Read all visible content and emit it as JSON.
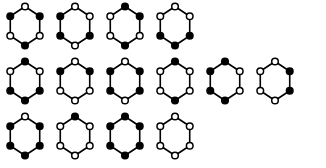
{
  "figure": {
    "background_color": "#ffffff",
    "edge_color": "#000000",
    "vertex_black_color": "#000000",
    "vertex_white_color": "#ffffff",
    "vertex_order": [
      "top",
      "upper-right",
      "lower-right",
      "bottom",
      "lower-left",
      "upper-left"
    ],
    "row_counts": [
      4,
      6,
      4
    ],
    "total_hexagons": 14
  },
  "rows": [
    {
      "index": 1,
      "hexagons": [
        {
          "id": "r1c1",
          "black_count": 3,
          "vertices": [
            "white",
            "black",
            "white",
            "black",
            "white",
            "black"
          ]
        },
        {
          "id": "r1c2",
          "black_count": 3,
          "vertices": [
            "white",
            "white",
            "black",
            "white",
            "black",
            "black"
          ]
        },
        {
          "id": "r1c3",
          "black_count": 3,
          "vertices": [
            "black",
            "black",
            "white",
            "black",
            "white",
            "white"
          ]
        },
        {
          "id": "r1c4",
          "black_count": 3,
          "vertices": [
            "white",
            "white",
            "black",
            "black",
            "black",
            "white"
          ]
        }
      ]
    },
    {
      "index": 2,
      "hexagons": [
        {
          "id": "r2c1",
          "black_count": 4,
          "vertices": [
            "black",
            "white",
            "black",
            "black",
            "black",
            "white"
          ]
        },
        {
          "id": "r2c2",
          "black_count": 2,
          "vertices": [
            "white",
            "black",
            "white",
            "white",
            "white",
            "black"
          ]
        },
        {
          "id": "r2c3",
          "black_count": 4,
          "vertices": [
            "white",
            "black",
            "black",
            "white",
            "black",
            "black"
          ]
        },
        {
          "id": "r2c4",
          "black_count": 2,
          "vertices": [
            "black",
            "white",
            "white",
            "black",
            "white",
            "white"
          ]
        },
        {
          "id": "r2c5",
          "black_count": 4,
          "vertices": [
            "black",
            "white",
            "white",
            "black",
            "black",
            "black"
          ]
        },
        {
          "id": "r2c6",
          "black_count": 2,
          "vertices": [
            "white",
            "black",
            "black",
            "white",
            "white",
            "white"
          ]
        }
      ]
    },
    {
      "index": 3,
      "hexagons": [
        {
          "id": "r3c1",
          "black_count": 5,
          "vertices": [
            "white",
            "black",
            "black",
            "black",
            "black",
            "black"
          ]
        },
        {
          "id": "r3c2",
          "black_count": 1,
          "vertices": [
            "black",
            "white",
            "white",
            "white",
            "white",
            "white"
          ]
        },
        {
          "id": "r3c3",
          "black_count": 6,
          "vertices": [
            "black",
            "black",
            "black",
            "black",
            "black",
            "black"
          ]
        },
        {
          "id": "r3c4",
          "black_count": 0,
          "vertices": [
            "white",
            "white",
            "white",
            "white",
            "white",
            "white"
          ]
        }
      ]
    }
  ]
}
